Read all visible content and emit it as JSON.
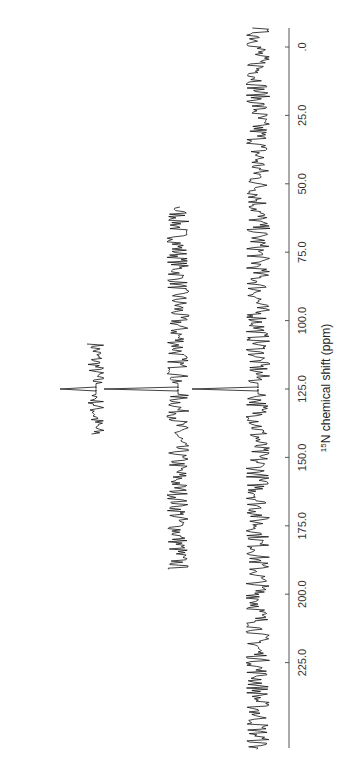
{
  "chart_data": {
    "type": "line",
    "title": "",
    "xlabel": "15N chemical shift (ppm)",
    "xlabel_parts": {
      "superscript": "15",
      "rest": "N chemical shift (ppm)"
    },
    "ylabel": "",
    "orientation": "rotated 90° (ppm axis vertical on right)",
    "xlim": [
      0,
      240
    ],
    "ticks": [
      0,
      25,
      50,
      75,
      100,
      125,
      150,
      175,
      200,
      225
    ],
    "tick_labels": [
      ".0",
      "25.0",
      "50.0",
      "75.0",
      "100.0",
      "125.0",
      "150.0",
      "175.0",
      "200.0",
      "225.0"
    ],
    "grid": false,
    "legend": null,
    "series": [
      {
        "name": "spectrum-1-narrow-window",
        "range_ppm": [
          108,
          141
        ],
        "peak_ppm": 125,
        "peak_height": "large",
        "noise": "high"
      },
      {
        "name": "spectrum-2-medium-window",
        "range_ppm": [
          58,
          191
        ],
        "peak_ppm": 125,
        "peak_height": "medium",
        "noise": "medium"
      },
      {
        "name": "spectrum-3-full-window",
        "range_ppm": [
          -7,
          257
        ],
        "peak_ppm": 125,
        "peak_height": "medium",
        "noise": "medium"
      }
    ]
  },
  "axis": {
    "title_sup": "15",
    "title_rest": "N chemical shift (ppm)",
    "tick_labels": [
      ".0",
      "25.0",
      "50.0",
      "75.0",
      "100.0",
      "125.0",
      "150.0",
      "175.0",
      "200.0",
      "225.0"
    ]
  }
}
